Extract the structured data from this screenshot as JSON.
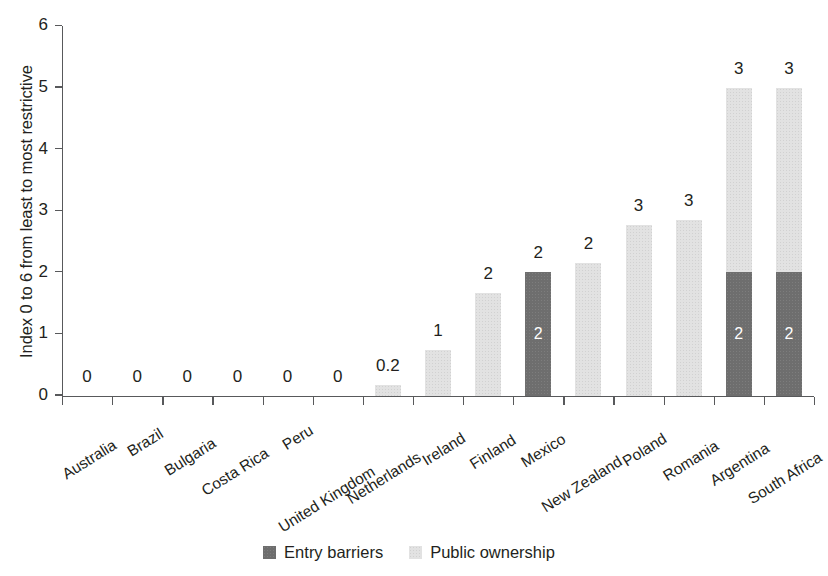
{
  "chart_data": {
    "type": "bar",
    "stacked": true,
    "title": "",
    "subtitle": "",
    "xlabel": "",
    "ylabel": "Index 0 to 6 from least to most restrictive",
    "ylim": [
      0,
      6
    ],
    "yticks": [
      "0",
      "1",
      "2",
      "3",
      "4",
      "5",
      "6"
    ],
    "grid": false,
    "legend_position": "bottom",
    "categories": [
      "Australia",
      "Brazil",
      "Bulgaria",
      "Costa Rica",
      "Peru",
      "United Kingdom",
      "Netherlands",
      "Ireland",
      "Finland",
      "Mexico",
      "New Zealand",
      "Poland",
      "Romania",
      "Argentina",
      "South Africa"
    ],
    "series": [
      {
        "name": "Entry barriers",
        "color": "#6e6e6e",
        "values": [
          0,
          0,
          0,
          0,
          0,
          0,
          0,
          0,
          0,
          2.0,
          0,
          0,
          0,
          2.0,
          2.0
        ]
      },
      {
        "name": "Public ownership",
        "color": "#e2e2e2",
        "values": [
          0,
          0,
          0,
          0,
          0,
          0,
          0.17,
          0.74,
          1.67,
          0,
          2.16,
          2.77,
          2.85,
          3.0,
          3.0
        ]
      }
    ],
    "totals": [
      0,
      0,
      0,
      0,
      0,
      0,
      0.17,
      0.74,
      1.67,
      2.0,
      2.16,
      2.77,
      2.85,
      5.0,
      5.0
    ],
    "top_labels": [
      "0",
      "0",
      "0",
      "0",
      "0",
      "0",
      "0.2",
      "1",
      "2",
      "2",
      "2",
      "3",
      "3",
      "3",
      "3"
    ],
    "inner_labels": [
      "",
      "",
      "",
      "",
      "",
      "",
      "",
      "",
      "",
      "2",
      "",
      "",
      "",
      "2",
      "2"
    ]
  },
  "legend": {
    "items": [
      {
        "label": "Entry barriers",
        "color": "#6e6e6e"
      },
      {
        "label": "Public ownership",
        "color": "#e2e2e2"
      }
    ]
  }
}
